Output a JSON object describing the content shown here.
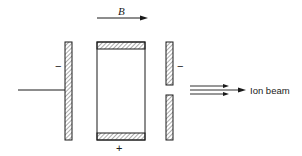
{
  "diagram": {
    "field_label": "B",
    "left_plate_sign": "−",
    "right_plate_sign": "−",
    "center_electrode_sign": "+",
    "beam_label": "Ion beam",
    "colors": {
      "line": "#1a1a1a",
      "background": "#ffffff"
    }
  }
}
